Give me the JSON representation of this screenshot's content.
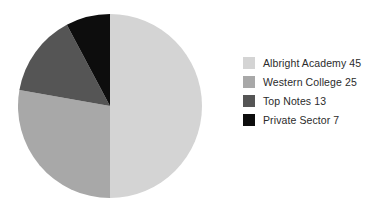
{
  "chart_data": {
    "type": "pie",
    "title": "",
    "labels": [
      "Albright Academy",
      "Western College",
      "Top Notes",
      "Private Sector"
    ],
    "values": [
      45,
      25,
      13,
      7
    ],
    "total": 90,
    "percentages": [
      50.0,
      27.8,
      14.4,
      7.8
    ],
    "colors": [
      "#d4d4d4",
      "#a8a8a8",
      "#555555",
      "#0d0d0d"
    ],
    "start_angle_deg": 0,
    "direction": "clockwise",
    "legend_position": "right",
    "grid": false,
    "legend_entries": [
      {
        "label": "Albright Academy 45",
        "name": "Albright Academy",
        "value": 45,
        "color": "#d4d4d4"
      },
      {
        "label": "Western College 25",
        "name": "Western College",
        "value": 25,
        "color": "#a8a8a8"
      },
      {
        "label": "Top Notes 13",
        "name": "Top Notes",
        "value": 13,
        "color": "#555555"
      },
      {
        "label": "Private Sector 7",
        "name": "Private Sector",
        "value": 7,
        "color": "#0d0d0d"
      }
    ]
  },
  "legend": {
    "items": [
      {
        "label": "Albright Academy 45"
      },
      {
        "label": "Western College 25"
      },
      {
        "label": "Top Notes 13"
      },
      {
        "label": "Private Sector 7"
      }
    ]
  }
}
